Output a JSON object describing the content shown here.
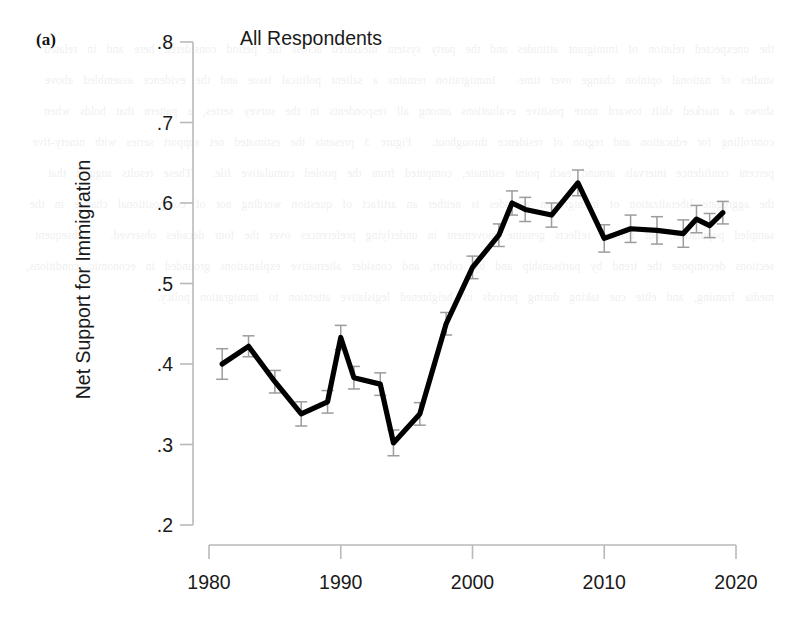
{
  "panel_label": "(a)",
  "yaxis_label": "Net Support for Immigration",
  "ghost_text": "the unexpected relation of immigrant attitudes and the party system measured across the period considered here and in related studies of national opinion change over time.  Immigration remains a salient political issue and the evidence assembled above shows a marked shift toward more positive evaluations among all respondents in the survey series, a pattern that holds when controlling for education and region of residence throughout.  Figure 3 presents the estimated net support series with ninety-five percent confidence intervals around each point estimate, computed from the pooled cumulative file.  These results suggest that the aggregate liberalization of immigration attitudes is neither an artifact of question wording nor of compositional change in the sampled population, but instead reflects genuine movement in underlying preferences over the four decades observed.  Subsequent sections decompose the trend by partisanship and by cohort, and consider alternative explanations grounded in economic conditions, media framing, and elite cue taking during periods of heightened legislative attention to immigration policy.",
  "chart_data": {
    "type": "line",
    "title": "All Respondents",
    "xlabel": "",
    "ylabel": "Net Support for Immigration",
    "xlim": [
      1978.0,
      2021.0
    ],
    "ylim": [
      0.2,
      0.8
    ],
    "xticks": [
      1980,
      1990,
      2000,
      2010,
      2020
    ],
    "xtick_labels": [
      "1980",
      "1990",
      "2000",
      "2010",
      "2020"
    ],
    "yticks": [
      0.2,
      0.3,
      0.4,
      0.5,
      0.6,
      0.7,
      0.8
    ],
    "ytick_labels": [
      ".2",
      ".3",
      ".4",
      ".5",
      ".6",
      ".7",
      ".8"
    ],
    "grid": false,
    "legend": "none",
    "error_bars": true,
    "series": [
      {
        "name": "All Respondents",
        "x": [
          1981,
          1983,
          1985,
          1987,
          1989,
          1990,
          1991,
          1993,
          1994,
          1996,
          1998,
          2000,
          2002,
          2003,
          2004,
          2006,
          2008,
          2010,
          2012,
          2014,
          2016,
          2017,
          2018,
          2019
        ],
        "values": [
          0.4,
          0.422,
          0.378,
          0.338,
          0.353,
          0.433,
          0.383,
          0.375,
          0.302,
          0.338,
          0.45,
          0.52,
          0.56,
          0.6,
          0.592,
          0.585,
          0.625,
          0.556,
          0.568,
          0.566,
          0.562,
          0.58,
          0.572,
          0.588
        ],
        "err_low": [
          0.381,
          0.409,
          0.364,
          0.323,
          0.339,
          0.418,
          0.369,
          0.361,
          0.286,
          0.324,
          0.436,
          0.506,
          0.546,
          0.585,
          0.577,
          0.57,
          0.609,
          0.539,
          0.551,
          0.549,
          0.545,
          0.563,
          0.557,
          0.574
        ],
        "err_high": [
          0.419,
          0.435,
          0.392,
          0.353,
          0.367,
          0.448,
          0.397,
          0.389,
          0.318,
          0.352,
          0.464,
          0.534,
          0.574,
          0.615,
          0.607,
          0.6,
          0.641,
          0.573,
          0.585,
          0.583,
          0.579,
          0.597,
          0.587,
          0.602
        ]
      }
    ]
  }
}
